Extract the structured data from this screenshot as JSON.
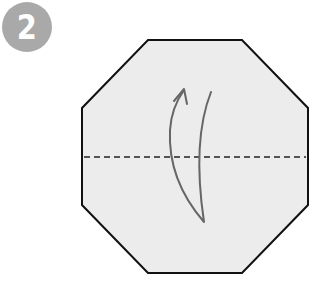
{
  "step": {
    "number": "2",
    "badge_color": "#a9a9a9"
  },
  "diagram": {
    "shape": "octagon",
    "fill": "#ececec",
    "stroke": "#111111",
    "fold_line": "valley fold (dashed, horizontal center)",
    "arrow": "fold bottom half up",
    "arrow_color": "#666666"
  }
}
